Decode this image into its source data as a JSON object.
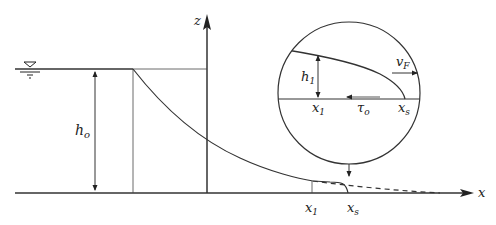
{
  "diagram": {
    "type": "dam-break flow profile with inset detail",
    "labels": {
      "z_axis": "z",
      "x_axis": "x",
      "h0_main": "h",
      "h0_sub": "o",
      "x1_main": "x",
      "x1_sub": "1",
      "xs_main": "x",
      "xs_sub": "s",
      "inset_h1_main": "h",
      "inset_h1_sub": "1",
      "inset_x1_main": "x",
      "inset_x1_sub": "1",
      "inset_xs_main": "x",
      "inset_xs_sub": "s",
      "inset_tau_main": "τ",
      "inset_tau_sub": "o",
      "inset_vf_main": "v",
      "inset_vf_sub": "F"
    },
    "symbols": {
      "water_level": "▽"
    },
    "colors": {
      "line": "#333333",
      "background": "#ffffff"
    }
  }
}
